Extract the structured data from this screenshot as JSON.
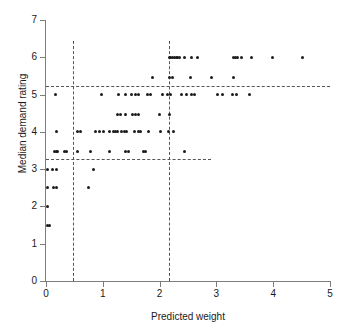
{
  "chart_data": {
    "type": "scatter",
    "title": "",
    "xlabel": "Predicted weight",
    "ylabel": "Median demand rating",
    "xlim": [
      0,
      5
    ],
    "ylim": [
      0,
      7
    ],
    "xticks": [
      0,
      1,
      2,
      3,
      4,
      5
    ],
    "yticks": [
      0,
      1,
      2,
      3,
      4,
      5,
      6,
      7
    ],
    "xticklabels": [
      "0",
      "1",
      "2",
      "3",
      "4",
      "5"
    ],
    "yticklabels": [
      "0",
      "1",
      "2",
      "3",
      "4",
      "5",
      "6",
      "7"
    ],
    "grid": false,
    "legend": null,
    "marker": "filled-circle",
    "marker_color": "#1c1c1c",
    "axis_color": "#7d7d7d",
    "reference_line_color": "#555555",
    "reference_lines": [
      {
        "name": "upper-horizontal-threshold",
        "orientation": "horizontal",
        "value": 5.23,
        "x_start": 0.0,
        "x_end": 5.0,
        "style": "dashed"
      },
      {
        "name": "lower-horizontal-threshold",
        "orientation": "horizontal",
        "value": 3.27,
        "x_start": 0.0,
        "x_end": 2.9,
        "style": "dashed"
      },
      {
        "name": "left-vertical-threshold",
        "orientation": "vertical",
        "value": 0.48,
        "y_start": 0.0,
        "y_end": 6.45,
        "style": "dashed"
      },
      {
        "name": "right-vertical-threshold",
        "orientation": "vertical",
        "value": 2.16,
        "y_start": 0.0,
        "y_end": 6.45,
        "style": "dashed"
      }
    ],
    "points": [
      [
        0.02,
        3.0
      ],
      [
        0.02,
        2.5
      ],
      [
        0.02,
        2.0
      ],
      [
        0.02,
        1.5
      ],
      [
        0.06,
        1.5
      ],
      [
        0.12,
        3.0
      ],
      [
        0.18,
        3.0
      ],
      [
        0.13,
        2.5
      ],
      [
        0.19,
        2.5
      ],
      [
        0.15,
        3.47
      ],
      [
        0.18,
        3.47
      ],
      [
        0.21,
        3.47
      ],
      [
        0.33,
        3.47
      ],
      [
        0.36,
        3.47
      ],
      [
        0.18,
        4.0
      ],
      [
        0.17,
        5.0
      ],
      [
        0.55,
        4.0
      ],
      [
        0.6,
        4.0
      ],
      [
        0.56,
        3.47
      ],
      [
        0.75,
        2.5
      ],
      [
        0.83,
        3.0
      ],
      [
        0.78,
        3.47
      ],
      [
        0.88,
        4.0
      ],
      [
        0.95,
        4.0
      ],
      [
        1.02,
        4.0
      ],
      [
        0.97,
        5.0
      ],
      [
        1.12,
        4.0
      ],
      [
        1.18,
        4.0
      ],
      [
        1.22,
        4.0
      ],
      [
        1.26,
        4.0
      ],
      [
        1.12,
        3.47
      ],
      [
        1.25,
        4.47
      ],
      [
        1.32,
        4.47
      ],
      [
        1.33,
        4.0
      ],
      [
        1.38,
        4.0
      ],
      [
        1.42,
        4.0
      ],
      [
        1.4,
        3.47
      ],
      [
        1.45,
        3.47
      ],
      [
        1.28,
        5.0
      ],
      [
        1.4,
        4.47
      ],
      [
        1.52,
        4.47
      ],
      [
        1.58,
        4.47
      ],
      [
        1.63,
        4.47
      ],
      [
        1.4,
        5.0
      ],
      [
        1.5,
        5.0
      ],
      [
        1.58,
        5.0
      ],
      [
        1.62,
        5.0
      ],
      [
        1.55,
        4.0
      ],
      [
        1.62,
        4.0
      ],
      [
        1.67,
        4.0
      ],
      [
        1.72,
        3.47
      ],
      [
        1.76,
        3.47
      ],
      [
        1.78,
        5.0
      ],
      [
        1.84,
        5.0
      ],
      [
        1.8,
        4.0
      ],
      [
        1.87,
        5.47
      ],
      [
        2.0,
        4.47
      ],
      [
        2.02,
        4.0
      ],
      [
        2.05,
        5.0
      ],
      [
        2.17,
        6.0
      ],
      [
        2.2,
        6.0
      ],
      [
        2.23,
        6.0
      ],
      [
        2.26,
        6.0
      ],
      [
        2.29,
        6.0
      ],
      [
        2.32,
        6.0
      ],
      [
        2.35,
        6.0
      ],
      [
        2.17,
        5.47
      ],
      [
        2.22,
        5.47
      ],
      [
        2.14,
        5.0
      ],
      [
        2.2,
        5.0
      ],
      [
        2.18,
        4.47
      ],
      [
        2.16,
        4.0
      ],
      [
        2.24,
        4.0
      ],
      [
        2.44,
        3.47
      ],
      [
        2.44,
        6.0
      ],
      [
        2.56,
        6.0
      ],
      [
        2.67,
        6.0
      ],
      [
        2.55,
        5.47
      ],
      [
        2.38,
        5.0
      ],
      [
        2.48,
        5.0
      ],
      [
        2.56,
        5.0
      ],
      [
        2.62,
        5.0
      ],
      [
        2.92,
        5.47
      ],
      [
        3.02,
        5.0
      ],
      [
        3.1,
        5.0
      ],
      [
        3.3,
        6.0
      ],
      [
        3.34,
        6.0
      ],
      [
        3.38,
        6.0
      ],
      [
        3.44,
        6.0
      ],
      [
        3.3,
        5.47
      ],
      [
        3.28,
        5.0
      ],
      [
        3.36,
        5.0
      ],
      [
        3.62,
        6.0
      ],
      [
        3.58,
        5.0
      ],
      [
        3.98,
        6.0
      ],
      [
        4.52,
        6.0
      ]
    ]
  }
}
